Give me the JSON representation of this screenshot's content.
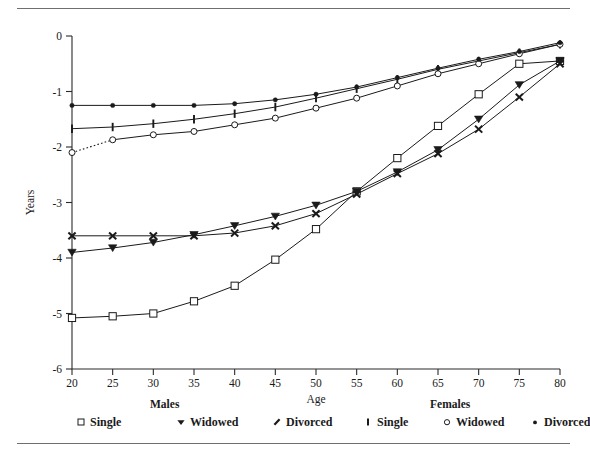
{
  "chart_data": {
    "type": "line",
    "title": "",
    "xlabel": "Age",
    "ylabel": "Years",
    "x": [
      20,
      25,
      30,
      35,
      40,
      45,
      50,
      55,
      60,
      65,
      70,
      75,
      80
    ],
    "xlim": [
      20,
      80
    ],
    "ylim": [
      -6,
      0
    ],
    "xticks": [
      20,
      25,
      30,
      35,
      40,
      45,
      50,
      55,
      60,
      65,
      70,
      75,
      80
    ],
    "yticks": [
      0,
      -1,
      -2,
      -3,
      -4,
      -5,
      -6
    ],
    "xtick_labels": [
      "20",
      "25",
      "30",
      "35",
      "40",
      "45",
      "50",
      "55",
      "60",
      "65",
      "70",
      "75",
      "80"
    ],
    "ytick_labels": [
      "0",
      "-1",
      "-2",
      "-3",
      "-4",
      "-5",
      "-6"
    ],
    "grid": false,
    "legend_position": "below",
    "series": [
      {
        "name": "Males Single",
        "group": "Males",
        "status": "Single",
        "marker": "open-square",
        "values": [
          -5.08,
          -5.05,
          -5.0,
          -4.78,
          -4.5,
          -4.03,
          -3.48,
          -2.8,
          -2.2,
          -1.62,
          -1.05,
          -0.5,
          -0.45
        ]
      },
      {
        "name": "Males Widowed",
        "group": "Males",
        "status": "Widowed",
        "marker": "filled-down-triangle",
        "values": [
          -3.9,
          -3.82,
          -3.72,
          -3.58,
          -3.42,
          -3.25,
          -3.05,
          -2.8,
          -2.45,
          -2.05,
          -1.5,
          -0.88,
          -0.45
        ]
      },
      {
        "name": "Males Divorced",
        "group": "Males",
        "status": "Divorced",
        "marker": "slash",
        "values": [
          -3.6,
          -3.6,
          -3.6,
          -3.6,
          -3.55,
          -3.42,
          -3.2,
          -2.85,
          -2.48,
          -2.12,
          -1.68,
          -1.1,
          -0.5
        ]
      },
      {
        "name": "Females Single",
        "group": "Females",
        "status": "Single",
        "marker": "vertical-bar",
        "values": [
          -1.67,
          -1.64,
          -1.58,
          -1.5,
          -1.4,
          -1.28,
          -1.12,
          -0.95,
          -0.78,
          -0.6,
          -0.45,
          -0.3,
          -0.15
        ]
      },
      {
        "name": "Females Widowed",
        "group": "Females",
        "status": "Widowed",
        "marker": "open-circle",
        "values": [
          -2.1,
          -1.87,
          -1.78,
          -1.72,
          -1.6,
          -1.48,
          -1.3,
          -1.12,
          -0.9,
          -0.68,
          -0.5,
          -0.32,
          -0.15
        ]
      },
      {
        "name": "Females Divorced",
        "group": "Females",
        "status": "Divorced",
        "marker": "filled-dot",
        "values": [
          -1.25,
          -1.25,
          -1.25,
          -1.25,
          -1.22,
          -1.15,
          -1.05,
          -0.92,
          -0.75,
          -0.58,
          -0.42,
          -0.28,
          -0.12
        ]
      }
    ],
    "annotations": [
      {
        "note": "dotted segment connecting Females Widowed age 20 to age 25",
        "series": "Females Widowed",
        "from_x": 20,
        "to_x": 25,
        "style": "dotted"
      }
    ]
  },
  "axes": {
    "x_title": "Age",
    "y_title": "Years"
  },
  "legend": {
    "groups": [
      {
        "title": "Males",
        "items": [
          {
            "label": "Single",
            "marker": "open-square"
          },
          {
            "label": "Widowed",
            "marker": "filled-down-triangle"
          },
          {
            "label": "Divorced",
            "marker": "slash"
          }
        ]
      },
      {
        "title": "Females",
        "items": [
          {
            "label": "Single",
            "marker": "vertical-bar"
          },
          {
            "label": "Widowed",
            "marker": "open-circle"
          },
          {
            "label": "Divorced",
            "marker": "filled-dot"
          }
        ]
      }
    ]
  },
  "colors": {
    "ink": "#1a1a1a",
    "rule": "#6f6f6f",
    "background": "#ffffff"
  }
}
